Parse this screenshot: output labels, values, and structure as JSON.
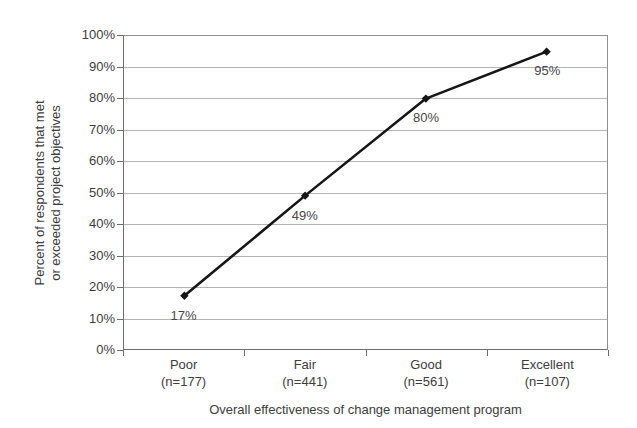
{
  "chart_data": {
    "type": "line",
    "title": "",
    "categories": [
      "Poor",
      "Fair",
      "Good",
      "Excellent"
    ],
    "category_sublabels": [
      "(n=177)",
      "(n=441)",
      "(n=561)",
      "(n=107)"
    ],
    "values": [
      17,
      49,
      80,
      95
    ],
    "point_labels": [
      "17%",
      "49%",
      "80%",
      "95%"
    ],
    "xlabel": "Overall effectiveness of change management program",
    "ylabel": "Percent of respondents that met or exceeded project objectives",
    "ylabel_line1": "Percent of respondents that met",
    "ylabel_line2": "or exceeded project objectives",
    "y_ticks": [
      "100%",
      "90%",
      "80%",
      "70%",
      "60%",
      "50%",
      "40%",
      "30%",
      "20%",
      "10%",
      "0%"
    ],
    "ylim": [
      0,
      100
    ],
    "grid": true,
    "legend": "none",
    "marker": "diamond",
    "colors": {
      "line": "#161616",
      "marker": "#161616",
      "grid": "#b4b4b4",
      "plot_border": "#8f8f8f",
      "axis": "#6e6e6e",
      "text": "#3d3d3d",
      "background": "#ffffff"
    }
  }
}
